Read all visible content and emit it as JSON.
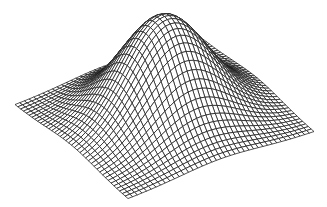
{
  "chart_data": {
    "type": "surface-wireframe",
    "title": "",
    "xlabel": "",
    "ylabel": "",
    "zlabel": "",
    "description": "3D wireframe mesh of a 2D Gaussian bump centered on a square domain",
    "function": "z = exp(-(x^2 + y^2) / (2 * sigma^2))",
    "x_range": [
      -1,
      1
    ],
    "y_range": [
      -1,
      1
    ],
    "z_range": [
      0,
      1
    ],
    "sigma": 0.43,
    "grid_lines_per_axis": 41,
    "axes_visible": false,
    "grid_on": false,
    "legend": null,
    "line_color": "#1a1a1a",
    "background_color": "#ffffff",
    "projection": {
      "corner_left_px": [
        15,
        105
      ],
      "corner_front_px": [
        128,
        199
      ],
      "corner_right_px": [
        314,
        132
      ],
      "peak_height_px": 102
    }
  }
}
